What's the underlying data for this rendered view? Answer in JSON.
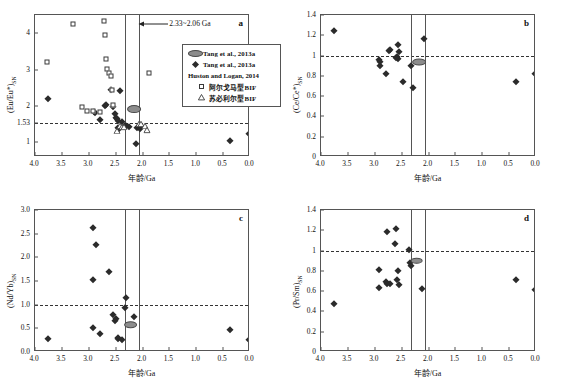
{
  "figure": {
    "xlabel": "年龄/Ga",
    "xlim": [
      4.0,
      0.0
    ],
    "xticks": [
      4.0,
      3.5,
      3.0,
      2.5,
      2.0,
      1.5,
      1.0,
      0.5,
      0.0
    ],
    "xticklabels": [
      "4.0",
      "3.5",
      "3.0",
      "2.5",
      "2.0",
      "1.5",
      "1.0",
      "0.5",
      "0.0"
    ],
    "event_band": {
      "start_ga": 2.33,
      "end_ga": 2.06,
      "label": "2.33~2.06 Ga"
    },
    "colors": {
      "marker_fill": "#2b2b2b",
      "open_marker_edge": "#3a3a3a",
      "ellipse_fill": "#8c8c8c",
      "axis": "#555555",
      "reference_line": "#333333"
    }
  },
  "legend": {
    "position": "panel-a-right",
    "rows": [
      {
        "symbol": "ellipse",
        "label": "Tang et al., 2013a"
      },
      {
        "symbol": "diamond",
        "label": "Tang et al., 2013a"
      },
      {
        "symbol": "none",
        "label": "Huston and Logan, 2014"
      },
      {
        "symbol": "square",
        "label": "阿尔戈马型BIF"
      },
      {
        "symbol": "triangle",
        "label": "苏必利尔型BIF"
      }
    ]
  },
  "chart_data": [
    {
      "id": "a",
      "type": "scatter",
      "panel_letter": "a",
      "ylabel": "(Eu/Eu*)SN",
      "ylabel_main": "(Eu/Eu*)",
      "ylabel_sub": "SN",
      "xlabel": "年龄/Ga",
      "xlim": [
        4.0,
        0.0
      ],
      "ylim": [
        0.6,
        4.5
      ],
      "yticks": [
        1,
        1.53,
        2,
        3,
        4
      ],
      "yticklabels": [
        "1",
        "1.53",
        "2",
        "3",
        "4"
      ],
      "reference_line": {
        "y": 1.53,
        "style": "dashed"
      },
      "vlines": [
        2.33,
        2.06
      ],
      "grid": false,
      "annotation": "2.33~2.06 Ga",
      "ellipse_marker": {
        "x": 2.16,
        "y": 1.92,
        "w_ga": 0.22,
        "h": 0.16
      },
      "series": [
        {
          "name": "Tang et al., 2013a",
          "marker": "diamond",
          "points": [
            [
              3.75,
              2.18
            ],
            [
              2.9,
              1.83
            ],
            [
              2.88,
              1.8
            ],
            [
              2.8,
              1.62
            ],
            [
              2.7,
              2.0
            ],
            [
              2.68,
              2.02
            ],
            [
              2.58,
              2.45
            ],
            [
              2.55,
              1.98
            ],
            [
              2.52,
              1.77
            ],
            [
              2.5,
              1.68
            ],
            [
              2.48,
              1.64
            ],
            [
              2.46,
              1.6
            ],
            [
              2.45,
              1.4
            ],
            [
              2.44,
              1.38
            ],
            [
              2.42,
              2.4
            ],
            [
              2.38,
              1.56
            ],
            [
              2.33,
              1.45
            ],
            [
              2.3,
              1.44
            ],
            [
              2.26,
              1.43
            ],
            [
              2.1,
              1.41
            ],
            [
              2.05,
              1.38
            ],
            [
              2.12,
              0.97
            ],
            [
              0.38,
              1.05
            ],
            [
              0.02,
              1.22
            ]
          ]
        },
        {
          "name": "阿尔戈马型BIF",
          "marker": "square",
          "points": [
            [
              3.78,
              3.2
            ],
            [
              3.3,
              4.25
            ],
            [
              3.12,
              1.98
            ],
            [
              3.04,
              1.86
            ],
            [
              2.92,
              1.85
            ],
            [
              2.8,
              1.83
            ],
            [
              2.72,
              4.33
            ],
            [
              2.7,
              3.96
            ],
            [
              2.68,
              3.28
            ],
            [
              2.66,
              3.02
            ],
            [
              2.62,
              2.92
            ],
            [
              2.58,
              2.82
            ],
            [
              2.56,
              2.45
            ],
            [
              2.54,
              2.03
            ],
            [
              1.88,
              2.92
            ]
          ]
        },
        {
          "name": "苏必利尔型BIF",
          "marker": "triangle",
          "points": [
            [
              2.48,
              1.32
            ],
            [
              2.42,
              1.44
            ],
            [
              2.38,
              1.42
            ],
            [
              2.34,
              1.43
            ],
            [
              2.06,
              1.52
            ],
            [
              2.02,
              1.5
            ],
            [
              1.96,
              1.46
            ],
            [
              1.92,
              1.33
            ]
          ]
        }
      ]
    },
    {
      "id": "b",
      "type": "scatter",
      "panel_letter": "b",
      "ylabel": "(Ce/Ce*)SN",
      "ylabel_main": "(Ce/Ce*)",
      "ylabel_sub": "SN",
      "xlabel": "年龄/Ga",
      "xlim": [
        4.0,
        0.0
      ],
      "ylim": [
        0,
        1.4
      ],
      "yticks": [
        0,
        0.2,
        0.4,
        0.6,
        0.8,
        1,
        1.2,
        1.4
      ],
      "yticklabels": [
        "0",
        "0.2",
        "0.4",
        "0.6",
        "0.8",
        "1",
        "1.2",
        "1.4"
      ],
      "reference_line": {
        "y": 1.0,
        "style": "dashed"
      },
      "vlines": [
        2.33,
        2.06
      ],
      "grid": false,
      "ellipse_marker": {
        "x": 2.18,
        "y": 0.935,
        "w_ga": 0.22,
        "h": 0.05
      },
      "series": [
        {
          "name": "Tang et al., 2013a",
          "marker": "diamond",
          "points": [
            [
              3.75,
              1.245
            ],
            [
              2.92,
              0.955
            ],
            [
              2.9,
              0.935
            ],
            [
              2.91,
              0.895
            ],
            [
              2.8,
              0.82
            ],
            [
              2.73,
              1.045
            ],
            [
              2.72,
              1.055
            ],
            [
              2.56,
              1.1
            ],
            [
              2.55,
              1.04
            ],
            [
              2.58,
              0.985
            ],
            [
              2.57,
              0.965
            ],
            [
              2.6,
              0.975
            ],
            [
              2.47,
              0.74
            ],
            [
              2.32,
              0.9
            ],
            [
              2.28,
              0.68
            ],
            [
              2.08,
              1.165
            ],
            [
              0.38,
              0.74
            ],
            [
              0.01,
              0.82
            ]
          ]
        }
      ]
    },
    {
      "id": "c",
      "type": "scatter",
      "panel_letter": "c",
      "ylabel": "(Nd/Yb)SN",
      "ylabel_main": "(Nd/Yb)",
      "ylabel_sub": "SN",
      "xlabel": "年龄/Ga",
      "xlim": [
        4.0,
        0.0
      ],
      "ylim": [
        0,
        3.0
      ],
      "yticks": [
        0,
        0.5,
        1.0,
        1.5,
        2.0,
        2.5,
        3.0
      ],
      "yticklabels": [
        "0.0",
        "0.5",
        "1.0",
        "1.5",
        "2.0",
        "2.5",
        "3.0"
      ],
      "reference_line": {
        "y": 1.0,
        "style": "dashed"
      },
      "vlines": [
        2.33,
        2.06
      ],
      "grid": false,
      "ellipse_marker": {
        "x": 2.22,
        "y": 0.575,
        "w_ga": 0.22,
        "h": 0.12
      },
      "series": [
        {
          "name": "Tang et al., 2013a",
          "marker": "diamond",
          "points": [
            [
              3.75,
              0.28
            ],
            [
              2.93,
              2.61
            ],
            [
              2.86,
              2.27
            ],
            [
              2.92,
              1.53
            ],
            [
              2.93,
              0.51
            ],
            [
              2.8,
              0.39
            ],
            [
              2.62,
              1.68
            ],
            [
              2.55,
              0.775
            ],
            [
              2.52,
              0.66
            ],
            [
              2.5,
              0.69
            ],
            [
              2.46,
              0.3
            ],
            [
              2.45,
              0.28
            ],
            [
              2.38,
              0.255
            ],
            [
              2.3,
              1.14
            ],
            [
              2.33,
              0.92
            ],
            [
              2.15,
              0.735
            ],
            [
              0.38,
              0.47
            ],
            [
              0.01,
              0.25
            ]
          ]
        }
      ]
    },
    {
      "id": "d",
      "type": "scatter",
      "panel_letter": "d",
      "ylabel": "(Pr/Sm)SN",
      "ylabel_main": "(Pr/Sm)",
      "ylabel_sub": "SN",
      "xlabel": "年龄/Ga",
      "xlim": [
        4.0,
        0.0
      ],
      "ylim": [
        0,
        1.4
      ],
      "yticks": [
        0,
        0.2,
        0.4,
        0.6,
        0.8,
        1,
        1.2,
        1.4
      ],
      "yticklabels": [
        "0",
        "0.2",
        "0.4",
        "0.6",
        "0.8",
        "1",
        "1.2",
        "1.4"
      ],
      "reference_line": {
        "y": 1.0,
        "style": "dashed"
      },
      "vlines": [
        2.33,
        2.06
      ],
      "grid": false,
      "ellipse_marker": {
        "x": 2.22,
        "y": 0.9,
        "w_ga": 0.2,
        "h": 0.045
      },
      "series": [
        {
          "name": "Tang et al., 2013a",
          "marker": "diamond",
          "points": [
            [
              3.75,
              0.475
            ],
            [
              2.93,
              0.81
            ],
            [
              2.92,
              0.635
            ],
            [
              2.78,
              1.18
            ],
            [
              2.8,
              0.69
            ],
            [
              2.78,
              0.67
            ],
            [
              2.72,
              0.675
            ],
            [
              2.6,
              1.21
            ],
            [
              2.62,
              1.06
            ],
            [
              2.58,
              0.705
            ],
            [
              2.56,
              0.8
            ],
            [
              2.54,
              0.66
            ],
            [
              2.36,
              1.005
            ],
            [
              2.34,
              0.88
            ],
            [
              2.33,
              0.85
            ],
            [
              2.12,
              0.62
            ],
            [
              0.38,
              0.71
            ],
            [
              0.01,
              0.61
            ]
          ]
        }
      ]
    }
  ]
}
